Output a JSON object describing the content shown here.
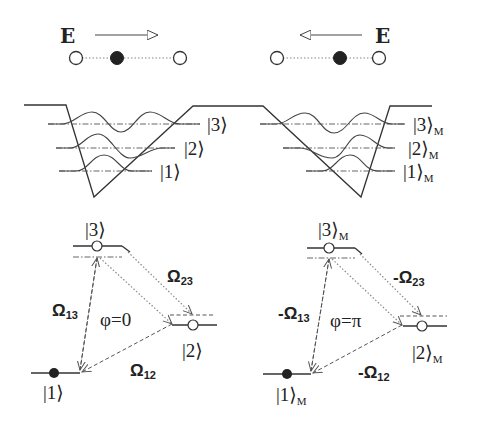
{
  "panels": {
    "left": {
      "efield": {
        "label": "E",
        "direction": "right"
      },
      "atoms": [
        "open",
        "filled",
        "open"
      ],
      "well_levels": [
        {
          "ket": "|3⟩",
          "ket_open": "|",
          "ket_num": "3",
          "ket_close": "⟩",
          "subscript": ""
        },
        {
          "ket": "|2⟩",
          "ket_open": "|",
          "ket_num": "2",
          "ket_close": "⟩",
          "subscript": ""
        },
        {
          "ket": "|1⟩",
          "ket_open": "|",
          "ket_num": "1",
          "ket_close": "⟩",
          "subscript": ""
        }
      ],
      "energy_levels": {
        "level3": {
          "ket_num": "3",
          "subscript": ""
        },
        "level2": {
          "ket_num": "2",
          "subscript": ""
        },
        "level1": {
          "ket_num": "1",
          "subscript": ""
        }
      },
      "couplings": {
        "omega13": {
          "symbol": "Ω",
          "sub": "13",
          "sign": ""
        },
        "omega23": {
          "symbol": "Ω",
          "sub": "23",
          "sign": ""
        },
        "omega12": {
          "symbol": "Ω",
          "sub": "12",
          "sign": ""
        }
      },
      "phase": "φ=0"
    },
    "right": {
      "efield": {
        "label": "E",
        "direction": "left"
      },
      "atoms": [
        "open",
        "filled",
        "open"
      ],
      "well_levels": [
        {
          "ket": "|3⟩M",
          "ket_open": "|",
          "ket_num": "3",
          "ket_close": "⟩",
          "subscript": "M"
        },
        {
          "ket": "|2⟩M",
          "ket_open": "|",
          "ket_num": "2",
          "ket_close": "⟩",
          "subscript": "M"
        },
        {
          "ket": "|1⟩M",
          "ket_open": "|",
          "ket_num": "1",
          "ket_close": "⟩",
          "subscript": "M"
        }
      ],
      "energy_levels": {
        "level3": {
          "ket_num": "3",
          "subscript": "M"
        },
        "level2": {
          "ket_num": "2",
          "subscript": "M"
        },
        "level1": {
          "ket_num": "1",
          "subscript": "M"
        }
      },
      "couplings": {
        "omega13": {
          "symbol": "Ω",
          "sub": "13",
          "sign": "-"
        },
        "omega23": {
          "symbol": "Ω",
          "sub": "23",
          "sign": "-"
        },
        "omega12": {
          "symbol": "Ω",
          "sub": "12",
          "sign": "-"
        }
      },
      "phase": "φ=π"
    }
  },
  "colors": {
    "ink": "#222222",
    "background": "#ffffff"
  }
}
